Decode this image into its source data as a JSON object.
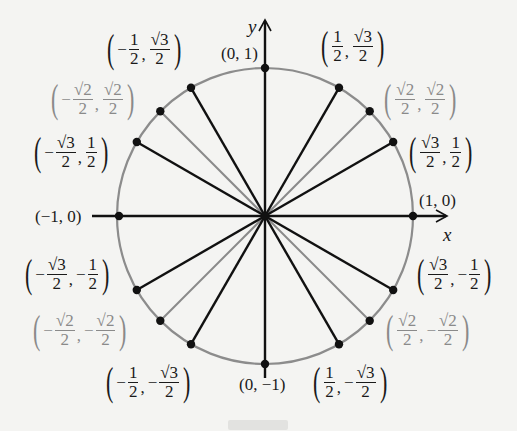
{
  "figure": {
    "x_axis_label": "x",
    "y_axis_label": "y",
    "center": [
      0,
      0
    ],
    "radius": 1,
    "colors": {
      "circle": "#8c8c8c",
      "black_rays": "#111111",
      "gray_rays": "#8a8a8a",
      "gray_labels": "#8a8a8a",
      "black_labels": "#1a1a1a",
      "background": "#f4f4f2"
    },
    "points": [
      {
        "angle_deg": 0,
        "label": "(1, 0)",
        "x": "1",
        "y": "0",
        "style": "black"
      },
      {
        "angle_deg": 30,
        "label": "(√3/2, 1/2)",
        "x": "√3/2",
        "y": "1/2",
        "style": "black"
      },
      {
        "angle_deg": 45,
        "label": "(√2/2, √2/2)",
        "x": "√2/2",
        "y": "√2/2",
        "style": "gray"
      },
      {
        "angle_deg": 60,
        "label": "(1/2, √3/2)",
        "x": "1/2",
        "y": "√3/2",
        "style": "black"
      },
      {
        "angle_deg": 90,
        "label": "(0, 1)",
        "x": "0",
        "y": "1",
        "style": "black"
      },
      {
        "angle_deg": 120,
        "label": "(-1/2, √3/2)",
        "x": "-1/2",
        "y": "√3/2",
        "style": "black"
      },
      {
        "angle_deg": 135,
        "label": "(-√2/2, √2/2)",
        "x": "-√2/2",
        "y": "√2/2",
        "style": "gray"
      },
      {
        "angle_deg": 150,
        "label": "(-√3/2, 1/2)",
        "x": "-√3/2",
        "y": "1/2",
        "style": "black"
      },
      {
        "angle_deg": 180,
        "label": "(-1, 0)",
        "x": "-1",
        "y": "0",
        "style": "black"
      },
      {
        "angle_deg": 210,
        "label": "(-√3/2, -1/2)",
        "x": "-√3/2",
        "y": "-1/2",
        "style": "black"
      },
      {
        "angle_deg": 225,
        "label": "(-√2/2, -√2/2)",
        "x": "-√2/2",
        "y": "-√2/2",
        "style": "gray"
      },
      {
        "angle_deg": 240,
        "label": "(-1/2, -√3/2)",
        "x": "-1/2",
        "y": "-√3/2",
        "style": "black"
      },
      {
        "angle_deg": 270,
        "label": "(0, -1)",
        "x": "0",
        "y": "-1",
        "style": "black"
      },
      {
        "angle_deg": 300,
        "label": "(1/2, -√3/2)",
        "x": "1/2",
        "y": "-√3/2",
        "style": "black"
      },
      {
        "angle_deg": 315,
        "label": "(√2/2, -√2/2)",
        "x": "√2/2",
        "y": "-√2/2",
        "style": "gray"
      },
      {
        "angle_deg": 330,
        "label": "(√3/2, -1/2)",
        "x": "√3/2",
        "y": "-1/2",
        "style": "black"
      }
    ]
  },
  "labels": {
    "p0": {
      "text": "(1, 0)"
    },
    "p90": {
      "text": "(0, 1)"
    },
    "p180": {
      "text": "(−1, 0)"
    },
    "p270": {
      "text": "(0, −1)"
    },
    "r3": "√3",
    "r2": "√2",
    "one": "1",
    "two": "2",
    "minus": "−",
    "comma": ",",
    "lp": "(",
    "rp": ")"
  }
}
